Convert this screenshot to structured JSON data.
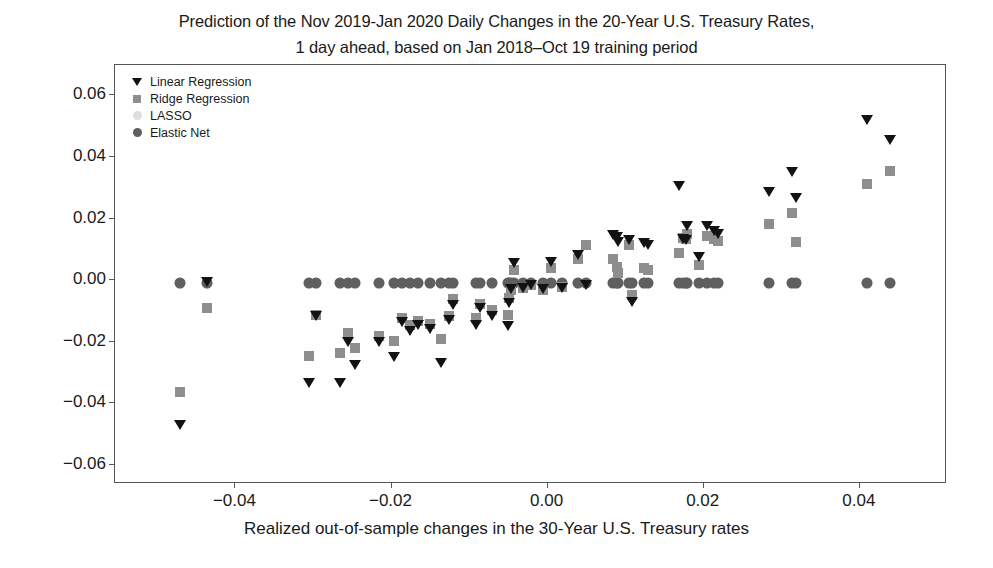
{
  "chart_data": {
    "type": "scatter",
    "title": "Prediction of the Nov 2019-Jan 2020 Daily Changes in the 20-Year U.S. Treasury Rates,\n1 day ahead, based on Jan 2018–Oct 19 training period",
    "xlabel": "Realized out-of-sample changes in the 30-Year U.S. Treasury rates",
    "ylabel": "",
    "xlim": [
      -0.0553,
      0.0513
    ],
    "ylim": [
      -0.0665,
      0.0695
    ],
    "xticks": [
      -0.04,
      -0.02,
      0.0,
      0.02,
      0.04
    ],
    "xtick_labels": [
      "−0.04",
      "−0.02",
      "0.00",
      "0.02",
      "0.04"
    ],
    "yticks": [
      -0.06,
      -0.04,
      -0.02,
      0.0,
      0.02,
      0.04,
      0.06
    ],
    "ytick_labels": [
      "−0.06",
      "−0.04",
      "−0.02",
      "0.00",
      "0.02",
      "0.04",
      "0.06"
    ],
    "grid": false,
    "legend_position": "upper left",
    "series": [
      {
        "name": "Linear Regression",
        "marker": "triangle-down",
        "color": "#121212",
        "points": [
          [
            -0.047,
            -0.047
          ],
          [
            -0.0435,
            -0.0005
          ],
          [
            -0.0305,
            -0.0335
          ],
          [
            -0.0295,
            -0.0115
          ],
          [
            -0.0265,
            -0.0335
          ],
          [
            -0.0255,
            -0.02
          ],
          [
            -0.0245,
            -0.0275
          ],
          [
            -0.0215,
            -0.02
          ],
          [
            -0.0195,
            -0.025
          ],
          [
            -0.0185,
            -0.0135
          ],
          [
            -0.0175,
            -0.0165
          ],
          [
            -0.0165,
            -0.0145
          ],
          [
            -0.015,
            -0.016
          ],
          [
            -0.0135,
            -0.027
          ],
          [
            -0.0125,
            -0.013
          ],
          [
            -0.012,
            -0.008
          ],
          [
            -0.009,
            -0.0145
          ],
          [
            -0.0085,
            -0.009
          ],
          [
            -0.007,
            -0.0115
          ],
          [
            -0.005,
            -0.015
          ],
          [
            -0.0048,
            -0.0075
          ],
          [
            -0.0045,
            -0.003
          ],
          [
            -0.0042,
            0.0055
          ],
          [
            -0.003,
            -0.0025
          ],
          [
            -0.002,
            -0.0015
          ],
          [
            -0.0005,
            -0.003
          ],
          [
            0.0005,
            0.006
          ],
          [
            0.002,
            -0.0025
          ],
          [
            0.004,
            0.008
          ],
          [
            0.005,
            -0.0015
          ],
          [
            0.0085,
            0.0145
          ],
          [
            0.009,
            0.014
          ],
          [
            0.0092,
            0.0125
          ],
          [
            0.0105,
            0.013
          ],
          [
            0.011,
            -0.007
          ],
          [
            0.0125,
            0.012
          ],
          [
            0.013,
            0.0115
          ],
          [
            0.017,
            0.0305
          ],
          [
            0.0175,
            0.0135
          ],
          [
            0.0178,
            0.013
          ],
          [
            0.018,
            0.0175
          ],
          [
            0.0195,
            0.0075
          ],
          [
            0.0205,
            0.0175
          ],
          [
            0.0215,
            0.016
          ],
          [
            0.022,
            0.015
          ],
          [
            0.0285,
            0.0285
          ],
          [
            0.0315,
            0.035
          ],
          [
            0.032,
            0.0265
          ],
          [
            0.041,
            0.052
          ],
          [
            0.044,
            0.0455
          ]
        ]
      },
      {
        "name": "Ridge Regression",
        "marker": "square",
        "color": "#8e8e8e",
        "points": [
          [
            -0.047,
            -0.0365
          ],
          [
            -0.0435,
            -0.0095
          ],
          [
            -0.0305,
            -0.025
          ],
          [
            -0.0295,
            -0.0115
          ],
          [
            -0.0265,
            -0.024
          ],
          [
            -0.0255,
            -0.0175
          ],
          [
            -0.0245,
            -0.0225
          ],
          [
            -0.0215,
            -0.0185
          ],
          [
            -0.0195,
            -0.02
          ],
          [
            -0.0185,
            -0.0125
          ],
          [
            -0.0175,
            -0.015
          ],
          [
            -0.0165,
            -0.0135
          ],
          [
            -0.015,
            -0.0145
          ],
          [
            -0.0135,
            -0.0195
          ],
          [
            -0.0125,
            -0.012
          ],
          [
            -0.012,
            -0.0065
          ],
          [
            -0.009,
            -0.0125
          ],
          [
            -0.0085,
            -0.008
          ],
          [
            -0.007,
            -0.01
          ],
          [
            -0.005,
            -0.0115
          ],
          [
            -0.0048,
            -0.006
          ],
          [
            -0.0045,
            -0.0035
          ],
          [
            -0.0042,
            0.003
          ],
          [
            -0.003,
            -0.003
          ],
          [
            -0.002,
            -0.002
          ],
          [
            -0.0005,
            -0.0035
          ],
          [
            0.0005,
            0.0035
          ],
          [
            0.002,
            -0.0025
          ],
          [
            0.004,
            0.0065
          ],
          [
            0.005,
            0.011
          ],
          [
            0.0085,
            0.0065
          ],
          [
            0.009,
            0.004
          ],
          [
            0.0092,
            0.002
          ],
          [
            0.0105,
            0.011
          ],
          [
            0.011,
            -0.005
          ],
          [
            0.0125,
            0.0035
          ],
          [
            0.013,
            0.003
          ],
          [
            0.017,
            0.0085
          ],
          [
            0.0175,
            0.0135
          ],
          [
            0.0178,
            0.013
          ],
          [
            0.018,
            0.0145
          ],
          [
            0.0195,
            0.0045
          ],
          [
            0.0205,
            0.014
          ],
          [
            0.0215,
            0.013
          ],
          [
            0.022,
            0.0125
          ],
          [
            0.0285,
            0.018
          ],
          [
            0.0315,
            0.0215
          ],
          [
            0.032,
            0.012
          ],
          [
            0.041,
            0.031
          ],
          [
            0.044,
            0.035
          ]
        ]
      },
      {
        "name": "LASSO",
        "marker": "circle-light",
        "color": "#d8d8d8",
        "points": [
          [
            -0.047,
            -0.0012
          ],
          [
            -0.0435,
            -0.0012
          ],
          [
            -0.0305,
            -0.0012
          ],
          [
            -0.0295,
            -0.0012
          ],
          [
            -0.0265,
            -0.0012
          ],
          [
            -0.0255,
            -0.0012
          ],
          [
            -0.0245,
            -0.0012
          ],
          [
            -0.0215,
            -0.0012
          ],
          [
            -0.0195,
            -0.0012
          ],
          [
            -0.0185,
            -0.0012
          ],
          [
            -0.0175,
            -0.0012
          ],
          [
            -0.0165,
            -0.0012
          ],
          [
            -0.015,
            -0.0012
          ],
          [
            -0.0135,
            -0.0012
          ],
          [
            -0.0125,
            -0.0012
          ],
          [
            -0.012,
            -0.0012
          ],
          [
            -0.009,
            -0.0012
          ],
          [
            -0.0085,
            -0.0012
          ],
          [
            -0.007,
            -0.0012
          ],
          [
            -0.005,
            -0.0012
          ],
          [
            -0.0048,
            -0.0012
          ],
          [
            -0.0045,
            -0.0012
          ],
          [
            -0.0042,
            -0.0012
          ],
          [
            -0.003,
            -0.0012
          ],
          [
            -0.002,
            -0.0012
          ],
          [
            -0.0005,
            -0.0012
          ],
          [
            0.0005,
            -0.0012
          ],
          [
            0.002,
            -0.0012
          ],
          [
            0.004,
            -0.0012
          ],
          [
            0.005,
            -0.0012
          ],
          [
            0.0085,
            -0.0012
          ],
          [
            0.009,
            -0.0012
          ],
          [
            0.0092,
            -0.0012
          ],
          [
            0.0105,
            -0.0012
          ],
          [
            0.011,
            -0.0012
          ],
          [
            0.0125,
            -0.0012
          ],
          [
            0.013,
            -0.0012
          ],
          [
            0.017,
            -0.0012
          ],
          [
            0.0175,
            -0.0012
          ],
          [
            0.0178,
            -0.0012
          ],
          [
            0.018,
            -0.0012
          ],
          [
            0.0195,
            -0.0012
          ],
          [
            0.0205,
            -0.0012
          ],
          [
            0.0215,
            -0.0012
          ],
          [
            0.022,
            -0.0012
          ],
          [
            0.0285,
            -0.0012
          ],
          [
            0.0315,
            -0.0012
          ],
          [
            0.032,
            -0.0012
          ],
          [
            0.041,
            -0.0012
          ],
          [
            0.044,
            -0.0012
          ]
        ]
      },
      {
        "name": "Elastic Net",
        "marker": "circle-dark",
        "color": "#5f5f5f",
        "points": [
          [
            -0.047,
            -0.0014
          ],
          [
            -0.0435,
            -0.0014
          ],
          [
            -0.0305,
            -0.0014
          ],
          [
            -0.0295,
            -0.0014
          ],
          [
            -0.0265,
            -0.0014
          ],
          [
            -0.0255,
            -0.0014
          ],
          [
            -0.0245,
            -0.0014
          ],
          [
            -0.0215,
            -0.0014
          ],
          [
            -0.0195,
            -0.0014
          ],
          [
            -0.0185,
            -0.0014
          ],
          [
            -0.0175,
            -0.0014
          ],
          [
            -0.0165,
            -0.0014
          ],
          [
            -0.015,
            -0.0014
          ],
          [
            -0.0135,
            -0.0014
          ],
          [
            -0.0125,
            -0.0014
          ],
          [
            -0.012,
            -0.0014
          ],
          [
            -0.009,
            -0.0014
          ],
          [
            -0.0085,
            -0.0014
          ],
          [
            -0.007,
            -0.0014
          ],
          [
            -0.005,
            -0.0014
          ],
          [
            -0.0048,
            -0.0014
          ],
          [
            -0.0045,
            -0.0014
          ],
          [
            -0.0042,
            -0.0014
          ],
          [
            -0.003,
            -0.0014
          ],
          [
            -0.002,
            -0.0014
          ],
          [
            -0.0005,
            -0.0014
          ],
          [
            0.0005,
            -0.0014
          ],
          [
            0.002,
            -0.0014
          ],
          [
            0.004,
            -0.0014
          ],
          [
            0.005,
            -0.0014
          ],
          [
            0.0085,
            -0.0014
          ],
          [
            0.009,
            -0.0014
          ],
          [
            0.0092,
            -0.0014
          ],
          [
            0.0105,
            -0.0014
          ],
          [
            0.011,
            -0.0014
          ],
          [
            0.0125,
            -0.0014
          ],
          [
            0.013,
            -0.0014
          ],
          [
            0.017,
            -0.0014
          ],
          [
            0.0175,
            -0.0014
          ],
          [
            0.0178,
            -0.0014
          ],
          [
            0.018,
            -0.0014
          ],
          [
            0.0195,
            -0.0014
          ],
          [
            0.0205,
            -0.0014
          ],
          [
            0.0215,
            -0.0014
          ],
          [
            0.022,
            -0.0014
          ],
          [
            0.0285,
            -0.0014
          ],
          [
            0.0315,
            -0.0014
          ],
          [
            0.032,
            -0.0014
          ],
          [
            0.041,
            -0.0014
          ],
          [
            0.044,
            -0.0014
          ]
        ]
      }
    ]
  }
}
